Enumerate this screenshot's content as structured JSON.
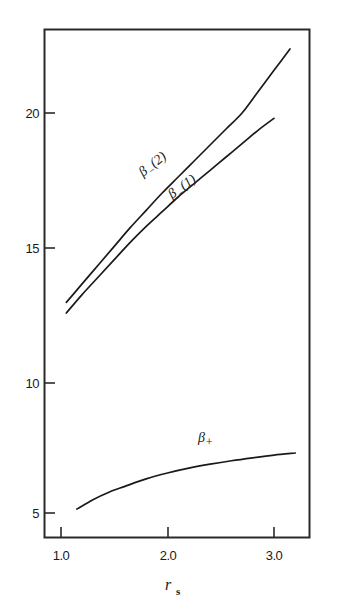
{
  "chart_data": {
    "type": "line",
    "title": "",
    "subtitle": "",
    "xlabel": "r_s",
    "ylabel": "",
    "xlim": [
      0.84,
      3.33
    ],
    "ylim": [
      3.1,
      23.9
    ],
    "grid": false,
    "legend": "inline-curve-labels",
    "xticks": [
      1.0,
      2.0,
      3.0
    ],
    "xtick_labels": [
      "1.0",
      "2.0",
      "3.0"
    ],
    "yticks": [
      5,
      10,
      15,
      20
    ],
    "ytick_labels": [
      "5",
      "10",
      "15",
      "20"
    ],
    "series": [
      {
        "name": "beta_minus_2",
        "label": "β",
        "label_sub": "−",
        "label_paren": "(2)",
        "x": [
          1.05,
          1.2,
          1.35,
          1.5,
          1.65,
          1.8,
          1.95,
          2.1,
          2.25,
          2.4,
          2.55,
          2.7,
          2.85,
          3.0,
          3.15
        ],
        "values": [
          12.9,
          13.6,
          14.3,
          15.0,
          15.7,
          16.35,
          17.0,
          17.6,
          18.2,
          18.8,
          19.4,
          20.0,
          20.8,
          21.6,
          22.4
        ]
      },
      {
        "name": "beta_minus_1",
        "label": "β",
        "label_sub": "−",
        "label_paren": "(1)",
        "x": [
          1.05,
          1.2,
          1.35,
          1.5,
          1.65,
          1.8,
          1.95,
          2.1,
          2.25,
          2.4,
          2.55,
          2.7,
          2.85,
          3.0
        ],
        "values": [
          12.5,
          13.2,
          13.85,
          14.5,
          15.15,
          15.75,
          16.3,
          16.85,
          17.35,
          17.85,
          18.35,
          18.85,
          19.35,
          19.8
        ]
      },
      {
        "name": "beta_plus",
        "label": "β",
        "label_sub": "+",
        "label_paren": "",
        "x": [
          1.15,
          1.3,
          1.45,
          1.6,
          1.8,
          2.0,
          2.2,
          2.4,
          2.6,
          2.8,
          3.0,
          3.2
        ],
        "values": [
          5.15,
          5.5,
          5.78,
          6.0,
          6.28,
          6.5,
          6.68,
          6.83,
          6.96,
          7.07,
          7.17,
          7.25
        ]
      }
    ],
    "annotations": [
      {
        "name": "label-beta-minus-2",
        "text": "β₋(2)",
        "x": 1.78,
        "y": 18.1
      },
      {
        "name": "label-beta-minus-1",
        "text": "β₋(1)",
        "x": 2.05,
        "y": 16.5
      },
      {
        "name": "label-beta-plus",
        "text": "β₊",
        "x": 2.18,
        "y": 7.85
      }
    ],
    "colors": {
      "line": "#1a1a1a",
      "frame": "#2a2a2a",
      "background": "#ffffff"
    }
  },
  "figure": {
    "xaxis_label_main": "r",
    "xaxis_label_sub": "s",
    "curve_labels": {
      "beta_minus_2": {
        "base": "β",
        "sub": "−",
        "tail": "(2)"
      },
      "beta_minus_1": {
        "base": "β",
        "sub": "−",
        "tail": "(1)"
      },
      "beta_plus": {
        "base": "β",
        "sub": "+",
        "tail": ""
      }
    },
    "ytick_texts": [
      "20",
      "15",
      "10",
      "5"
    ],
    "xtick_texts": [
      "1.0",
      "2.0",
      "3.0"
    ]
  }
}
